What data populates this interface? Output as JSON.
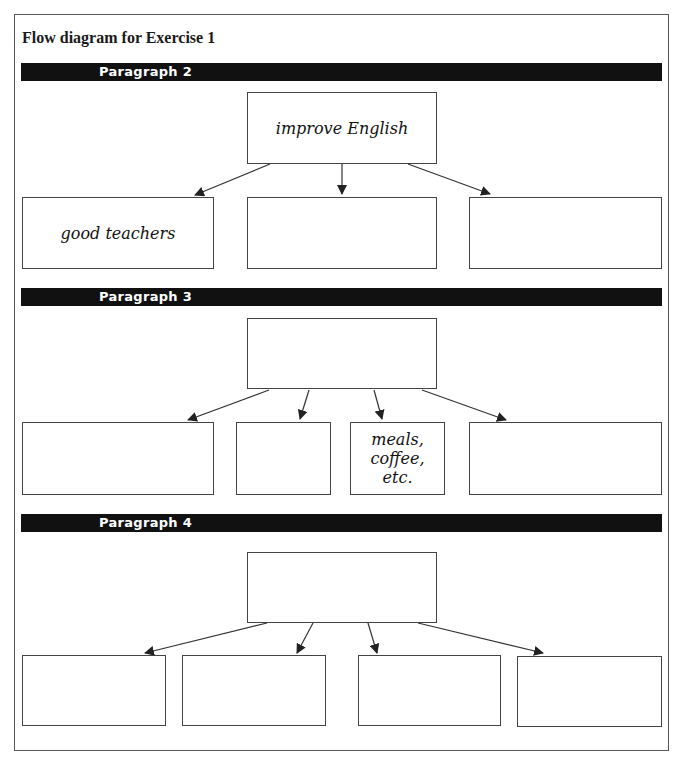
{
  "title": "Flow diagram for Exercise 1",
  "sections": [
    {
      "label": "Paragraph 2",
      "top_box": {
        "text": "improve English"
      },
      "boxes": [
        {
          "text": "good teachers"
        },
        {
          "text": ""
        },
        {
          "text": ""
        }
      ]
    },
    {
      "label": "Paragraph 3",
      "top_box": {
        "text": ""
      },
      "boxes": [
        {
          "text": ""
        },
        {
          "text": ""
        },
        {
          "text": "meals, coffee, etc."
        },
        {
          "text": ""
        }
      ]
    },
    {
      "label": "Paragraph 4",
      "top_box": {
        "text": ""
      },
      "boxes": [
        {
          "text": ""
        },
        {
          "text": ""
        },
        {
          "text": ""
        },
        {
          "text": ""
        }
      ]
    }
  ],
  "colors": {
    "bar": "#111111",
    "bar_text": "#ffffff",
    "border": "#444444",
    "background": "#ffffff"
  }
}
